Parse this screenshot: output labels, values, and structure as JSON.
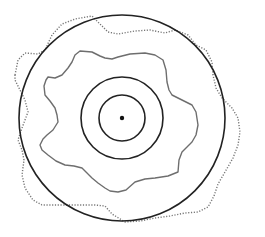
{
  "diagram": {
    "type": "concentric-regions",
    "center": {
      "x": 122,
      "y": 118
    },
    "colors": {
      "background": "#ffffff",
      "circle_stroke": "#222222",
      "irregular_stroke": "#6e6e6e",
      "dotted_stroke": "#777777",
      "center_dot": "#111111"
    },
    "circles": [
      {
        "name": "inner-circle",
        "r": 23
      },
      {
        "name": "middle-circle",
        "r": 41
      },
      {
        "name": "outer-circle",
        "r": 103
      }
    ],
    "irregular_region_points": "48,77 55,78 62,75 68,68 72,62 75,55 80,51 92,52 100,56 105,58 112,59 118,57 130,54 145,53 155,55 163,60 166,70 167,82 169,90 172,95 182,100 192,105 196,112 198,125 196,135 192,142 186,148 182,152 179,160 178,172 168,176 155,178 145,179 135,182 126,190 118,192 110,191 105,188 98,183 92,178 86,172 82,168 74,166 65,165 56,161 48,155 42,150 40,145 43,139 47,135 53,130 58,122 57,115 55,108 50,101 45,95 44,86 46,80",
    "dotted_region_points": "15,75 18,60 25,53 38,54 45,50 52,35 62,24 75,19 92,16 98,22 108,32 118,34 135,31 150,30 165,33 175,30 188,35 196,45 206,50 212,62 213,75 216,88 222,98 232,108 238,118 240,132 238,145 233,158 225,172 218,184 214,196 208,207 198,212 185,213 170,216 155,218 140,221 125,222 112,214 105,206 95,205 80,205 60,205 42,205 33,200 25,188 22,175 24,160 22,150 18,140 22,128 28,112 25,100 20,90 15,80"
  }
}
